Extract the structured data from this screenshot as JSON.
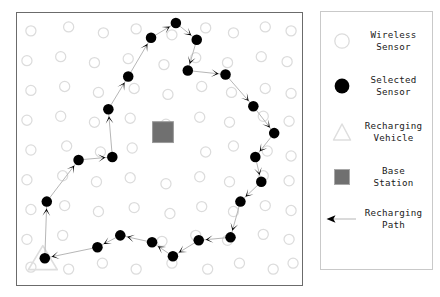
{
  "figure": {
    "width": 440,
    "height": 297,
    "background": "#ffffff"
  },
  "plot": {
    "border_color": "#6b6b6b",
    "background": "#ffffff",
    "x": 16,
    "y": 12,
    "width": 287,
    "height": 274
  },
  "colors": {
    "wireless_sensor_stroke": "#dcdcdc",
    "selected_sensor_fill": "#000000",
    "recharging_vehicle_stroke": "#dedede",
    "base_station_fill": "#707070",
    "base_station_stroke": "#9a9a9a",
    "path_line": "#b5b5b5",
    "arrow_fill": "#000000",
    "legend_border": "#c9c9c9",
    "text": "#1a1a1a"
  },
  "legend": {
    "x": 320,
    "y": 11,
    "width": 113,
    "height": 259,
    "items": [
      {
        "icon": "wireless-sensor-icon",
        "label": "Wireless\nSensor"
      },
      {
        "icon": "selected-sensor-icon",
        "label": "Selected\nSensor"
      },
      {
        "icon": "recharging-vehicle-icon",
        "label": "Recharging\nVehicle"
      },
      {
        "icon": "base-station-icon",
        "label": "Base\nStation"
      },
      {
        "icon": "recharging-path-icon",
        "label": "Recharging\nPath"
      }
    ],
    "row_tops": [
      12,
      57,
      103,
      148,
      190
    ]
  },
  "chart_data": {
    "type": "scatter",
    "title": "",
    "xlabel": "",
    "ylabel": "",
    "xlim": [
      0,
      287
    ],
    "ylim": [
      0,
      274
    ],
    "grid": false,
    "legend_position": "right",
    "base_station": {
      "x": 147,
      "y": 120,
      "size": 21
    },
    "recharging_vehicle": {
      "x": 26,
      "y": 248,
      "size": 22
    },
    "wireless_sensors": [
      {
        "x": 14,
        "y": 18
      },
      {
        "x": 52,
        "y": 14
      },
      {
        "x": 87,
        "y": 20
      },
      {
        "x": 120,
        "y": 16
      },
      {
        "x": 156,
        "y": 22
      },
      {
        "x": 190,
        "y": 15
      },
      {
        "x": 218,
        "y": 20
      },
      {
        "x": 250,
        "y": 14
      },
      {
        "x": 276,
        "y": 18
      },
      {
        "x": 10,
        "y": 48
      },
      {
        "x": 44,
        "y": 44
      },
      {
        "x": 78,
        "y": 50
      },
      {
        "x": 112,
        "y": 46
      },
      {
        "x": 148,
        "y": 52
      },
      {
        "x": 180,
        "y": 45
      },
      {
        "x": 212,
        "y": 50
      },
      {
        "x": 246,
        "y": 44
      },
      {
        "x": 272,
        "y": 49
      },
      {
        "x": 14,
        "y": 78
      },
      {
        "x": 48,
        "y": 74
      },
      {
        "x": 82,
        "y": 80
      },
      {
        "x": 118,
        "y": 76
      },
      {
        "x": 152,
        "y": 82
      },
      {
        "x": 186,
        "y": 74
      },
      {
        "x": 216,
        "y": 80
      },
      {
        "x": 250,
        "y": 76
      },
      {
        "x": 276,
        "y": 81
      },
      {
        "x": 10,
        "y": 108
      },
      {
        "x": 44,
        "y": 104
      },
      {
        "x": 78,
        "y": 110
      },
      {
        "x": 114,
        "y": 106
      },
      {
        "x": 150,
        "y": 112
      },
      {
        "x": 184,
        "y": 105
      },
      {
        "x": 214,
        "y": 110
      },
      {
        "x": 248,
        "y": 104
      },
      {
        "x": 274,
        "y": 109
      },
      {
        "x": 14,
        "y": 138
      },
      {
        "x": 50,
        "y": 134
      },
      {
        "x": 84,
        "y": 140
      },
      {
        "x": 116,
        "y": 136
      },
      {
        "x": 190,
        "y": 140
      },
      {
        "x": 218,
        "y": 134
      },
      {
        "x": 252,
        "y": 139
      },
      {
        "x": 276,
        "y": 144
      },
      {
        "x": 10,
        "y": 168
      },
      {
        "x": 46,
        "y": 164
      },
      {
        "x": 80,
        "y": 170
      },
      {
        "x": 114,
        "y": 166
      },
      {
        "x": 150,
        "y": 172
      },
      {
        "x": 184,
        "y": 165
      },
      {
        "x": 214,
        "y": 170
      },
      {
        "x": 248,
        "y": 164
      },
      {
        "x": 274,
        "y": 169
      },
      {
        "x": 14,
        "y": 198
      },
      {
        "x": 48,
        "y": 194
      },
      {
        "x": 82,
        "y": 200
      },
      {
        "x": 118,
        "y": 196
      },
      {
        "x": 154,
        "y": 202
      },
      {
        "x": 186,
        "y": 195
      },
      {
        "x": 218,
        "y": 200
      },
      {
        "x": 250,
        "y": 194
      },
      {
        "x": 276,
        "y": 199
      },
      {
        "x": 10,
        "y": 228
      },
      {
        "x": 46,
        "y": 224
      },
      {
        "x": 146,
        "y": 230
      },
      {
        "x": 180,
        "y": 224
      },
      {
        "x": 212,
        "y": 229
      },
      {
        "x": 248,
        "y": 223
      },
      {
        "x": 274,
        "y": 228
      },
      {
        "x": 14,
        "y": 256
      },
      {
        "x": 52,
        "y": 258
      },
      {
        "x": 86,
        "y": 252
      },
      {
        "x": 120,
        "y": 258
      },
      {
        "x": 156,
        "y": 252
      },
      {
        "x": 192,
        "y": 258
      },
      {
        "x": 224,
        "y": 252
      },
      {
        "x": 258,
        "y": 258
      },
      {
        "x": 278,
        "y": 252
      }
    ],
    "path_nodes": [
      {
        "x": 28,
        "y": 247,
        "label": "start"
      },
      {
        "x": 30,
        "y": 190
      },
      {
        "x": 62,
        "y": 148
      },
      {
        "x": 96,
        "y": 145
      },
      {
        "x": 92,
        "y": 97
      },
      {
        "x": 112,
        "y": 64
      },
      {
        "x": 135,
        "y": 25
      },
      {
        "x": 160,
        "y": 10
      },
      {
        "x": 181,
        "y": 27
      },
      {
        "x": 172,
        "y": 58
      },
      {
        "x": 210,
        "y": 62
      },
      {
        "x": 238,
        "y": 94
      },
      {
        "x": 259,
        "y": 121
      },
      {
        "x": 240,
        "y": 145
      },
      {
        "x": 246,
        "y": 170
      },
      {
        "x": 225,
        "y": 190
      },
      {
        "x": 215,
        "y": 226
      },
      {
        "x": 183,
        "y": 229
      },
      {
        "x": 157,
        "y": 245
      },
      {
        "x": 136,
        "y": 231
      },
      {
        "x": 104,
        "y": 224
      },
      {
        "x": 81,
        "y": 236
      }
    ]
  }
}
